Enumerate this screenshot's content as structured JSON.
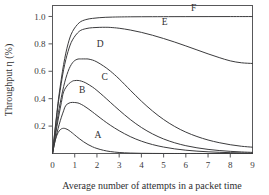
{
  "chart_data": {
    "type": "line",
    "title": "",
    "xlabel": "Average number of attempts in a packet time",
    "ylabel": "Throughput η (%)",
    "xlim": [
      0,
      9
    ],
    "ylim": [
      0,
      1.08
    ],
    "grid": false,
    "legend_position": "inline-labels",
    "xticks": [
      "0",
      "1",
      "2",
      "3",
      "4",
      "5",
      "6",
      "7",
      "8",
      "9"
    ],
    "xtick_values": [
      0,
      1,
      2,
      3,
      4,
      5,
      6,
      7,
      8,
      9
    ],
    "yticks": [
      "0.2",
      "0.4",
      "0.6",
      "0.8",
      "1.0"
    ],
    "ytick_values": [
      0.2,
      0.4,
      0.6,
      0.8,
      1.0
    ],
    "annotations": [
      {
        "text": "A",
        "x": 2.05,
        "y": 0.115
      },
      {
        "text": "B",
        "x": 1.33,
        "y": 0.445
      },
      {
        "text": "C",
        "x": 2.35,
        "y": 0.535
      },
      {
        "text": "D",
        "x": 2.15,
        "y": 0.775
      },
      {
        "text": "E",
        "x": 5.05,
        "y": 0.935
      },
      {
        "text": "F",
        "x": 6.35,
        "y": 1.04
      }
    ],
    "series": [
      {
        "name": "A",
        "label": "A",
        "peak_x": 0.5,
        "peak_y": 0.184,
        "x": [
          0.0,
          0.1,
          0.2,
          0.3,
          0.4,
          0.5,
          0.6,
          0.7,
          0.8,
          0.9,
          1.0,
          1.2,
          1.4,
          1.6,
          1.8,
          2.0,
          2.3,
          2.6,
          3.0,
          3.5,
          4.0,
          4.5,
          5.0,
          5.5,
          6.0,
          7.0,
          8.0,
          9.0
        ],
        "y": [
          0.0,
          0.0819,
          0.1341,
          0.1646,
          0.1798,
          0.1839,
          0.1807,
          0.1729,
          0.1616,
          0.1488,
          0.1353,
          0.1089,
          0.0852,
          0.0652,
          0.049,
          0.0366,
          0.0231,
          0.0142,
          0.0074,
          0.0032,
          0.0013,
          0.00056,
          0.00023,
          9e-05,
          4e-05,
          6e-06,
          9e-07,
          1e-07
        ]
      },
      {
        "name": "B",
        "label": "B",
        "peak_x": 1.1,
        "peak_y": 0.372,
        "x": [
          0.0,
          0.1,
          0.2,
          0.3,
          0.4,
          0.5,
          0.6,
          0.8,
          1.0,
          1.1,
          1.2,
          1.4,
          1.6,
          1.8,
          2.0,
          2.3,
          2.6,
          3.0,
          3.5,
          4.0,
          4.5,
          5.0,
          5.5,
          6.0,
          6.5,
          7.0,
          7.5,
          8.0,
          8.5,
          9.0
        ],
        "y": [
          0.0,
          0.0792,
          0.1493,
          0.211,
          0.2649,
          0.3115,
          0.3513,
          0.3713,
          0.372,
          0.37,
          0.3658,
          0.349,
          0.3273,
          0.3031,
          0.278,
          0.241,
          0.2066,
          0.1661,
          0.1232,
          0.09,
          0.0652,
          0.047,
          0.0337,
          0.0241,
          0.0172,
          0.0123,
          0.0087,
          0.0062,
          0.0044,
          0.0031
        ]
      },
      {
        "name": "C",
        "label": "C",
        "peak_x": 1.15,
        "peak_y": 0.533,
        "x": [
          0.0,
          0.1,
          0.2,
          0.3,
          0.4,
          0.5,
          0.7,
          0.9,
          1.0,
          1.15,
          1.3,
          1.5,
          1.8,
          2.0,
          2.3,
          2.6,
          3.0,
          3.5,
          4.0,
          4.5,
          5.0,
          5.5,
          6.0,
          6.5,
          7.0,
          7.5,
          8.0,
          8.5,
          9.0
        ],
        "y": [
          0.0,
          0.1019,
          0.1982,
          0.2886,
          0.3727,
          0.45,
          0.5029,
          0.528,
          0.532,
          0.533,
          0.528,
          0.515,
          0.485,
          0.46,
          0.418,
          0.374,
          0.316,
          0.248,
          0.19,
          0.143,
          0.106,
          0.078,
          0.057,
          0.0415,
          0.03,
          0.0217,
          0.0157,
          0.0113,
          0.0081
        ]
      },
      {
        "name": "D",
        "label": "D",
        "peak_x": 1.6,
        "peak_y": 0.69,
        "x": [
          0.0,
          0.1,
          0.2,
          0.3,
          0.5,
          0.7,
          0.9,
          1.1,
          1.3,
          1.5,
          1.6,
          1.8,
          2.0,
          2.3,
          2.6,
          3.0,
          3.5,
          4.0,
          4.5,
          5.0,
          5.5,
          6.0,
          6.5,
          7.0,
          7.5,
          8.0,
          8.5,
          9.0
        ],
        "y": [
          0.0,
          0.119,
          0.229,
          0.328,
          0.488,
          0.599,
          0.662,
          0.687,
          0.69,
          0.69,
          0.6895,
          0.682,
          0.668,
          0.638,
          0.602,
          0.544,
          0.462,
          0.382,
          0.31,
          0.248,
          0.197,
          0.156,
          0.124,
          0.0985,
          0.079,
          0.064,
          0.053,
          0.046
        ]
      },
      {
        "name": "E",
        "label": "E",
        "peak_x": 2.6,
        "peak_y": 0.921,
        "x": [
          0.0,
          0.1,
          0.2,
          0.3,
          0.5,
          0.7,
          0.9,
          1.2,
          1.5,
          1.8,
          2.1,
          2.4,
          2.6,
          3.0,
          3.5,
          4.0,
          4.5,
          5.0,
          5.5,
          6.0,
          6.5,
          7.0,
          7.5,
          8.0,
          8.5,
          9.0
        ],
        "y": [
          0.0,
          0.148,
          0.287,
          0.413,
          0.612,
          0.745,
          0.829,
          0.891,
          0.911,
          0.918,
          0.9205,
          0.921,
          0.92,
          0.914,
          0.901,
          0.884,
          0.863,
          0.839,
          0.813,
          0.785,
          0.756,
          0.727,
          0.7,
          0.676,
          0.662,
          0.657
        ]
      },
      {
        "name": "F",
        "label": "F",
        "peak_x": 9.0,
        "peak_y": 0.998,
        "x": [
          0.0,
          0.1,
          0.2,
          0.3,
          0.5,
          0.7,
          0.9,
          1.2,
          1.5,
          1.8,
          2.1,
          2.4,
          2.7,
          3.0,
          3.5,
          4.0,
          4.5,
          5.0,
          6.0,
          7.0,
          8.0,
          9.0
        ],
        "y": [
          0.0,
          0.155,
          0.301,
          0.435,
          0.65,
          0.8,
          0.89,
          0.954,
          0.977,
          0.986,
          0.991,
          0.994,
          0.9955,
          0.9965,
          0.9975,
          0.998,
          0.9983,
          0.9985,
          0.9988,
          0.999,
          0.9992,
          0.9993
        ]
      }
    ]
  },
  "colors": {
    "curve": "#3b3b3d",
    "axis": "#58585a",
    "text": "#2f2f31",
    "background": "#ffffff"
  }
}
